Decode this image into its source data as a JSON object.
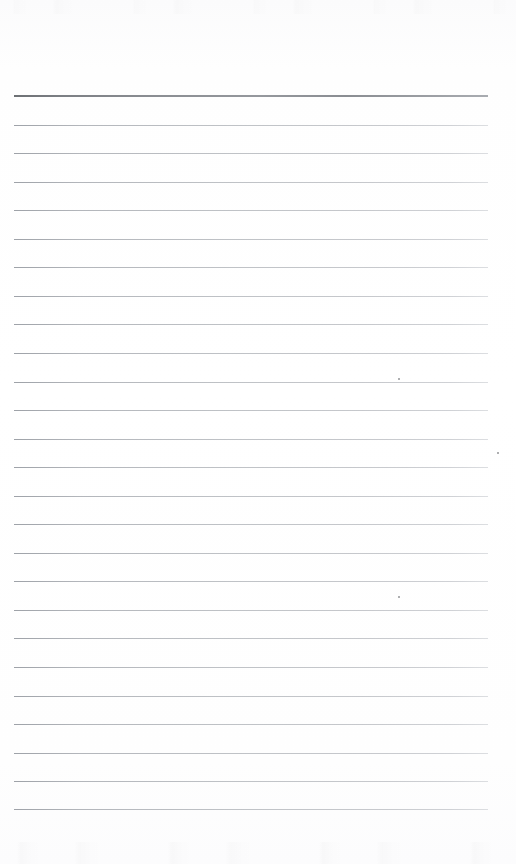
{
  "document": {
    "kind": "scanned-blank-ruled-page",
    "title": "Blank ruled notepad page",
    "page_width": 516,
    "page_height": 864,
    "background_color": "#fdfdfd",
    "has_text": false,
    "has_handwriting": false,
    "visible_text": ""
  },
  "ruling": {
    "line_count": 26,
    "first_line_y": 95,
    "line_spacing": 28.55,
    "left_margin_x": 14,
    "right_margin_x": 488,
    "line_length": 474,
    "body_rule_color": "#bfc2c6",
    "header_rule_color": "#8b8e93",
    "header_rule_index": 0,
    "header_rule_thickness": 2,
    "body_rule_thickness": 1,
    "lines": [
      {
        "index": 0,
        "y": 95,
        "weight": "header"
      },
      {
        "index": 1,
        "y": 124,
        "weight": "body"
      },
      {
        "index": 2,
        "y": 152,
        "weight": "body"
      },
      {
        "index": 3,
        "y": 181,
        "weight": "body"
      },
      {
        "index": 4,
        "y": 209,
        "weight": "body"
      },
      {
        "index": 5,
        "y": 238,
        "weight": "body"
      },
      {
        "index": 6,
        "y": 266,
        "weight": "body"
      },
      {
        "index": 7,
        "y": 295,
        "weight": "body"
      },
      {
        "index": 8,
        "y": 323,
        "weight": "body"
      },
      {
        "index": 9,
        "y": 352,
        "weight": "body"
      },
      {
        "index": 10,
        "y": 381,
        "weight": "body"
      },
      {
        "index": 11,
        "y": 409,
        "weight": "body"
      },
      {
        "index": 12,
        "y": 438,
        "weight": "body"
      },
      {
        "index": 13,
        "y": 466,
        "weight": "body"
      },
      {
        "index": 14,
        "y": 495,
        "weight": "body"
      },
      {
        "index": 15,
        "y": 523,
        "weight": "body"
      },
      {
        "index": 16,
        "y": 552,
        "weight": "body"
      },
      {
        "index": 17,
        "y": 580,
        "weight": "body"
      },
      {
        "index": 18,
        "y": 609,
        "weight": "body"
      },
      {
        "index": 19,
        "y": 637,
        "weight": "body"
      },
      {
        "index": 20,
        "y": 666,
        "weight": "body"
      },
      {
        "index": 21,
        "y": 695,
        "weight": "body"
      },
      {
        "index": 22,
        "y": 723,
        "weight": "body"
      },
      {
        "index": 23,
        "y": 752,
        "weight": "body"
      },
      {
        "index": 24,
        "y": 780,
        "weight": "body"
      },
      {
        "index": 25,
        "y": 808,
        "weight": "body"
      }
    ]
  },
  "scan_artifacts": {
    "top_noise_band": {
      "y": 0,
      "height": 14
    },
    "bottom_noise_band": {
      "y": 842,
      "height": 22
    },
    "specks": [
      {
        "x": 398,
        "y": 378,
        "size": 2
      },
      {
        "x": 398,
        "y": 596,
        "size": 2
      },
      {
        "x": 497,
        "y": 452,
        "size": 2
      }
    ]
  }
}
